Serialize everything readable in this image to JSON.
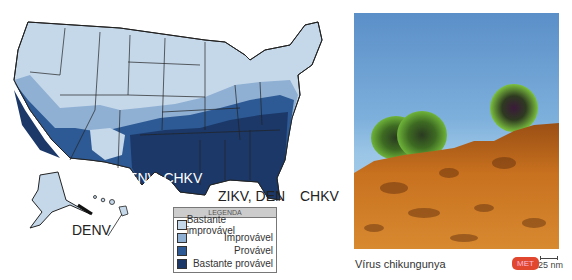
{
  "map": {
    "labels": {
      "south_central": "DENV, CHKV",
      "florida": "ZIKV, DEN",
      "east": "CHKV",
      "alaska_hawaii": "DENV"
    },
    "colors": {
      "bastante_improvavel": "#c5d8ea",
      "improvavel": "#8fb0d3",
      "provavel": "#2d5a94",
      "bastante_provavel": "#1b3868"
    }
  },
  "legend": {
    "title": "LEGENDA",
    "items": [
      {
        "label": "Bastante improvável",
        "color": "#c5d8ea"
      },
      {
        "label": "Improvável",
        "color": "#8fb0d3"
      },
      {
        "label": "Provável",
        "color": "#2d5a94"
      },
      {
        "label": "Bastante provável",
        "color": "#1b3868"
      }
    ]
  },
  "photo": {
    "caption": "Vírus chikungunya",
    "badge": "MET",
    "scale": "25 nm"
  }
}
